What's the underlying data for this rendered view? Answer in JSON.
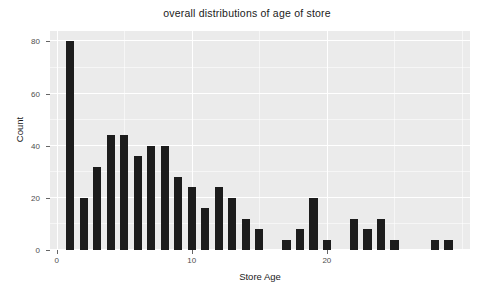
{
  "chart_data": {
    "type": "bar",
    "title": "overall distributions of age of store",
    "xlabel": "Store Age",
    "ylabel": "Count",
    "categories": [
      1,
      2,
      3,
      4,
      5,
      6,
      7,
      8,
      9,
      10,
      11,
      12,
      13,
      14,
      15,
      17,
      18,
      19,
      20,
      22,
      23,
      24,
      25,
      28,
      29
    ],
    "values": [
      80,
      20,
      32,
      44,
      44,
      36,
      40,
      40,
      28,
      24,
      16,
      24,
      20,
      12,
      8,
      4,
      8,
      20,
      4,
      12,
      8,
      12,
      4,
      4,
      4
    ],
    "bars": [
      {
        "x": 1,
        "y": 80
      },
      {
        "x": 2,
        "y": 20
      },
      {
        "x": 3,
        "y": 32
      },
      {
        "x": 4,
        "y": 44
      },
      {
        "x": 5,
        "y": 44
      },
      {
        "x": 6,
        "y": 36
      },
      {
        "x": 7,
        "y": 40
      },
      {
        "x": 8,
        "y": 40
      },
      {
        "x": 9,
        "y": 28
      },
      {
        "x": 10,
        "y": 24
      },
      {
        "x": 11,
        "y": 16
      },
      {
        "x": 12,
        "y": 24
      },
      {
        "x": 13,
        "y": 20
      },
      {
        "x": 14,
        "y": 12
      },
      {
        "x": 15,
        "y": 8
      },
      {
        "x": 17,
        "y": 4
      },
      {
        "x": 18,
        "y": 8
      },
      {
        "x": 19,
        "y": 20
      },
      {
        "x": 20,
        "y": 4
      },
      {
        "x": 22,
        "y": 12
      },
      {
        "x": 23,
        "y": 8
      },
      {
        "x": 24,
        "y": 12
      },
      {
        "x": 25,
        "y": 4
      },
      {
        "x": 28,
        "y": 4
      },
      {
        "x": 29,
        "y": 4
      }
    ],
    "xlim": [
      -0.5,
      30.6
    ],
    "ylim": [
      0,
      84
    ],
    "xticks": [
      0,
      10,
      20
    ],
    "xticklabels": [
      "0",
      "10",
      "20"
    ],
    "yticks": [
      0,
      20,
      40,
      60,
      80
    ],
    "yticklabels": [
      "0",
      "20",
      "40",
      "60",
      "80"
    ],
    "grid": true,
    "legend": false,
    "bar_color": "#1c1c1c",
    "panel_color": "#ebebeb",
    "gridline_color": "#ffffff",
    "bar_width": 0.62
  }
}
